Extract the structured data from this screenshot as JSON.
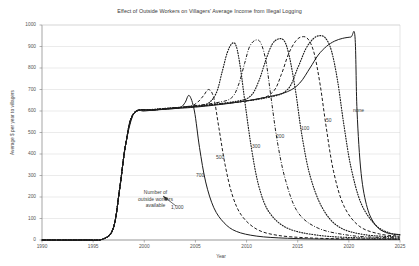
{
  "chart_data": {
    "type": "line",
    "title": "Effect of Outside Workers on Villagers' Average Income from Illegal Logging",
    "xlabel": "Year",
    "ylabel": "Average $ per year to villagers",
    "xlim": [
      1990,
      2025
    ],
    "ylim": [
      0,
      1000
    ],
    "xticks": [
      "1990",
      "1995",
      "2000",
      "2005",
      "2010",
      "2015",
      "2020",
      "2025"
    ],
    "yticks": [
      "0",
      "100",
      "200",
      "300",
      "400",
      "500",
      "600",
      "700",
      "800",
      "900",
      "1000"
    ],
    "grid": "horizontal",
    "legend_position": "inline-labels",
    "annotations": [
      {
        "text_line1": "Number of",
        "text_line2": "outside workers",
        "text_line3": "available",
        "points_to": "1,000"
      }
    ],
    "series": [
      {
        "name": "1,000",
        "label": "1,000",
        "style": "solid",
        "x": [
          1990,
          1994,
          1996,
          1997,
          1997.6,
          1998.2,
          1999,
          2000,
          2001,
          2002,
          2003,
          2003.6,
          2004,
          2004.4,
          2004.9,
          2005.4,
          2006,
          2006.8,
          2007.8,
          2009,
          2011,
          2014,
          2018,
          2022,
          2025
        ],
        "y": [
          0,
          0,
          5,
          60,
          240,
          450,
          590,
          600,
          604,
          608,
          612,
          618,
          640,
          672,
          600,
          430,
          270,
          150,
          80,
          40,
          18,
          8,
          4,
          3,
          3
        ]
      },
      {
        "name": "700",
        "label": "700",
        "style": "dashed",
        "x": [
          1990,
          1994,
          1996,
          1997,
          1997.6,
          1998.2,
          1999,
          2001,
          2003,
          2004.5,
          2005.2,
          2005.8,
          2006.3,
          2006.8,
          2007.3,
          2007.9,
          2008.6,
          2009.5,
          2011,
          2013,
          2016,
          2020,
          2025
        ],
        "y": [
          0,
          0,
          5,
          60,
          240,
          450,
          590,
          605,
          614,
          622,
          640,
          672,
          700,
          660,
          520,
          350,
          210,
          115,
          50,
          22,
          10,
          5,
          4
        ]
      },
      {
        "name": "500",
        "label": "500",
        "style": "dotted",
        "x": [
          1990,
          1994,
          1996,
          1997,
          1997.6,
          1998.2,
          1999,
          2001,
          2004,
          2006,
          2007,
          2007.6,
          2008.1,
          2008.6,
          2009,
          2009.4,
          2009.9,
          2010.5,
          2011.2,
          2012.2,
          2014,
          2017,
          2021,
          2025
        ],
        "y": [
          0,
          0,
          5,
          60,
          240,
          450,
          590,
          605,
          618,
          630,
          680,
          780,
          870,
          915,
          900,
          800,
          620,
          420,
          250,
          130,
          55,
          22,
          10,
          8
        ]
      },
      {
        "name": "300",
        "label": "300",
        "style": "dashdot",
        "x": [
          1990,
          1994,
          1996,
          1997,
          1997.6,
          1998.2,
          1999,
          2001,
          2004,
          2007,
          2008.5,
          2009.2,
          2009.8,
          2010.3,
          2010.9,
          2011.4,
          2011.9,
          2012.4,
          2013,
          2013.8,
          2015,
          2017,
          2020,
          2023,
          2025
        ],
        "y": [
          0,
          0,
          5,
          60,
          240,
          450,
          590,
          605,
          620,
          638,
          660,
          720,
          820,
          900,
          930,
          915,
          830,
          660,
          460,
          280,
          130,
          55,
          22,
          12,
          10
        ]
      },
      {
        "name": "200",
        "label": "200",
        "style": "dotted",
        "x": [
          1990,
          1994,
          1996,
          1997,
          1997.6,
          1998.2,
          1999,
          2001,
          2005,
          2009,
          2010.4,
          2011.2,
          2011.9,
          2012.5,
          2013.1,
          2013.7,
          2014.2,
          2014.8,
          2015.4,
          2016.2,
          2017.4,
          2019,
          2021.5,
          2025
        ],
        "y": [
          0,
          0,
          5,
          60,
          240,
          450,
          590,
          606,
          622,
          645,
          670,
          740,
          840,
          910,
          935,
          925,
          850,
          690,
          490,
          300,
          150,
          62,
          25,
          14
        ]
      },
      {
        "name": "100",
        "label": "100",
        "style": "dashed",
        "x": [
          1990,
          1994,
          1996,
          1997,
          1997.6,
          1998.2,
          1999,
          2001,
          2006,
          2011,
          2012.6,
          2013.4,
          2014.1,
          2014.8,
          2015.4,
          2016,
          2016.6,
          2017.2,
          2017.8,
          2018.5,
          2019.5,
          2021,
          2023,
          2025
        ],
        "y": [
          0,
          0,
          5,
          60,
          240,
          450,
          590,
          607,
          626,
          655,
          690,
          770,
          865,
          925,
          945,
          935,
          870,
          720,
          520,
          320,
          160,
          65,
          28,
          18
        ]
      },
      {
        "name": "50",
        "label": "50",
        "style": "dotted",
        "x": [
          1990,
          1994,
          1996,
          1997,
          1997.6,
          1998.2,
          1999,
          2001,
          2007,
          2012,
          2014,
          2015,
          2015.8,
          2016.5,
          2017.1,
          2017.7,
          2018.3,
          2018.9,
          2019.5,
          2020.2,
          2021.2,
          2022.6,
          2024,
          2025
        ],
        "y": [
          0,
          0,
          5,
          60,
          240,
          450,
          590,
          608,
          630,
          662,
          700,
          800,
          890,
          935,
          950,
          940,
          880,
          740,
          540,
          340,
          170,
          70,
          32,
          24
        ]
      },
      {
        "name": "none",
        "label": "none",
        "style": "solid",
        "x": [
          1990,
          1994,
          1996,
          1997,
          1997.6,
          1998.2,
          1999,
          2001,
          2005,
          2009,
          2012,
          2014,
          2015.2,
          2016.2,
          2017,
          2017.8,
          2018.6,
          2019.4,
          2020.2,
          2020.6,
          2020.8,
          2021.2,
          2021.8,
          2022.6,
          2023.6,
          2025
        ],
        "y": [
          0,
          0,
          5,
          60,
          240,
          450,
          590,
          605,
          618,
          640,
          665,
          690,
          730,
          800,
          860,
          900,
          925,
          938,
          944,
          945,
          600,
          310,
          150,
          70,
          35,
          25
        ]
      }
    ]
  },
  "curve_labels": [
    {
      "text": "1,000",
      "x": 171,
      "y": 204
    },
    {
      "text": "700",
      "x": 196,
      "y": 172
    },
    {
      "text": "500",
      "x": 216,
      "y": 154
    },
    {
      "text": "300",
      "x": 252,
      "y": 143
    },
    {
      "text": "200",
      "x": 276,
      "y": 133
    },
    {
      "text": "100",
      "x": 301,
      "y": 125
    },
    {
      "text": "50",
      "x": 326,
      "y": 117
    },
    {
      "text": "none",
      "x": 353,
      "y": 107
    }
  ],
  "annotation": {
    "line1": "Number of",
    "line2": "outside workers",
    "line3": "available"
  }
}
